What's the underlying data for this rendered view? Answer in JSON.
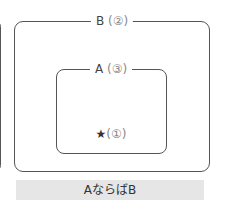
{
  "diagram": {
    "outer_set": {
      "name": "B",
      "marker": "(②)"
    },
    "inner_set": {
      "name": "A",
      "marker": "(③)"
    },
    "element": {
      "symbol": "★",
      "marker": "(①)"
    },
    "caption": "AならばB"
  },
  "colors": {
    "border": "#555555",
    "caption_bg": "#e6e6e6",
    "text": "#333333"
  }
}
